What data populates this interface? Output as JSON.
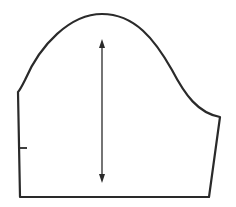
{
  "diagram": {
    "stroke_color": "#2a2a2a",
    "background": "#ffffff",
    "shape": {
      "left_top": [
        18,
        92
      ],
      "left_bottom": [
        20,
        197
      ],
      "right_bottom": [
        209,
        197
      ],
      "right_top": [
        220,
        117
      ],
      "cap_peak": [
        102,
        14
      ]
    },
    "notch": {
      "x1": 18,
      "x2": 27,
      "y": 148
    },
    "grainline": {
      "x": 102,
      "y_top": 40,
      "y_bottom": 182,
      "arrows": "both"
    }
  }
}
